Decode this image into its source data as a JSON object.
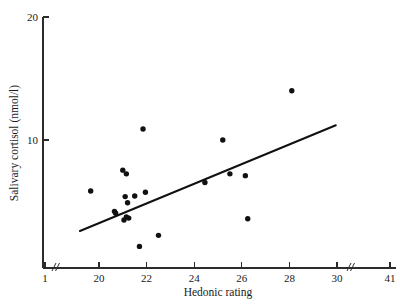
{
  "chart_data": {
    "type": "scatter",
    "title": "",
    "xlabel": "Hedonic rating",
    "ylabel": "Salivary cortisol (nmol/l)",
    "xlim": [
      19.0,
      31.0
    ],
    "ylim": [
      0.5,
      20.0
    ],
    "grid": false,
    "legend": null,
    "x_ticks": [
      {
        "label": "1",
        "value": 1
      },
      {
        "label": "20",
        "value": 20
      },
      {
        "label": "22",
        "value": 22
      },
      {
        "label": "24",
        "value": 24
      },
      {
        "label": "26",
        "value": 26
      },
      {
        "label": "28",
        "value": 28
      },
      {
        "label": "30",
        "value": 30
      },
      {
        "label": "41",
        "value": 41
      }
    ],
    "y_ticks": [
      {
        "label": "10",
        "value": 10
      },
      {
        "label": "20",
        "value": 20
      }
    ],
    "axis_breaks": {
      "x_after_first_tick": true,
      "x_before_last_tick": true
    },
    "points": [
      {
        "x": 19.65,
        "y": 5.85
      },
      {
        "x": 20.65,
        "y": 4.2
      },
      {
        "x": 20.7,
        "y": 4.05
      },
      {
        "x": 21.0,
        "y": 7.55
      },
      {
        "x": 21.05,
        "y": 3.5
      },
      {
        "x": 21.1,
        "y": 5.4
      },
      {
        "x": 21.15,
        "y": 7.25
      },
      {
        "x": 21.15,
        "y": 3.75
      },
      {
        "x": 21.2,
        "y": 4.9
      },
      {
        "x": 21.25,
        "y": 3.65
      },
      {
        "x": 21.5,
        "y": 5.45
      },
      {
        "x": 21.7,
        "y": 1.35
      },
      {
        "x": 21.85,
        "y": 10.9
      },
      {
        "x": 21.95,
        "y": 5.75
      },
      {
        "x": 22.5,
        "y": 2.25
      },
      {
        "x": 24.45,
        "y": 6.55
      },
      {
        "x": 25.2,
        "y": 10.0
      },
      {
        "x": 25.5,
        "y": 7.25
      },
      {
        "x": 26.15,
        "y": 7.1
      },
      {
        "x": 26.25,
        "y": 3.6
      },
      {
        "x": 28.1,
        "y": 14.0
      }
    ],
    "fit_line": {
      "x_start": 19.2,
      "y_start": 2.6,
      "x_end": 29.95,
      "y_end": 11.2,
      "style": "solid"
    }
  }
}
